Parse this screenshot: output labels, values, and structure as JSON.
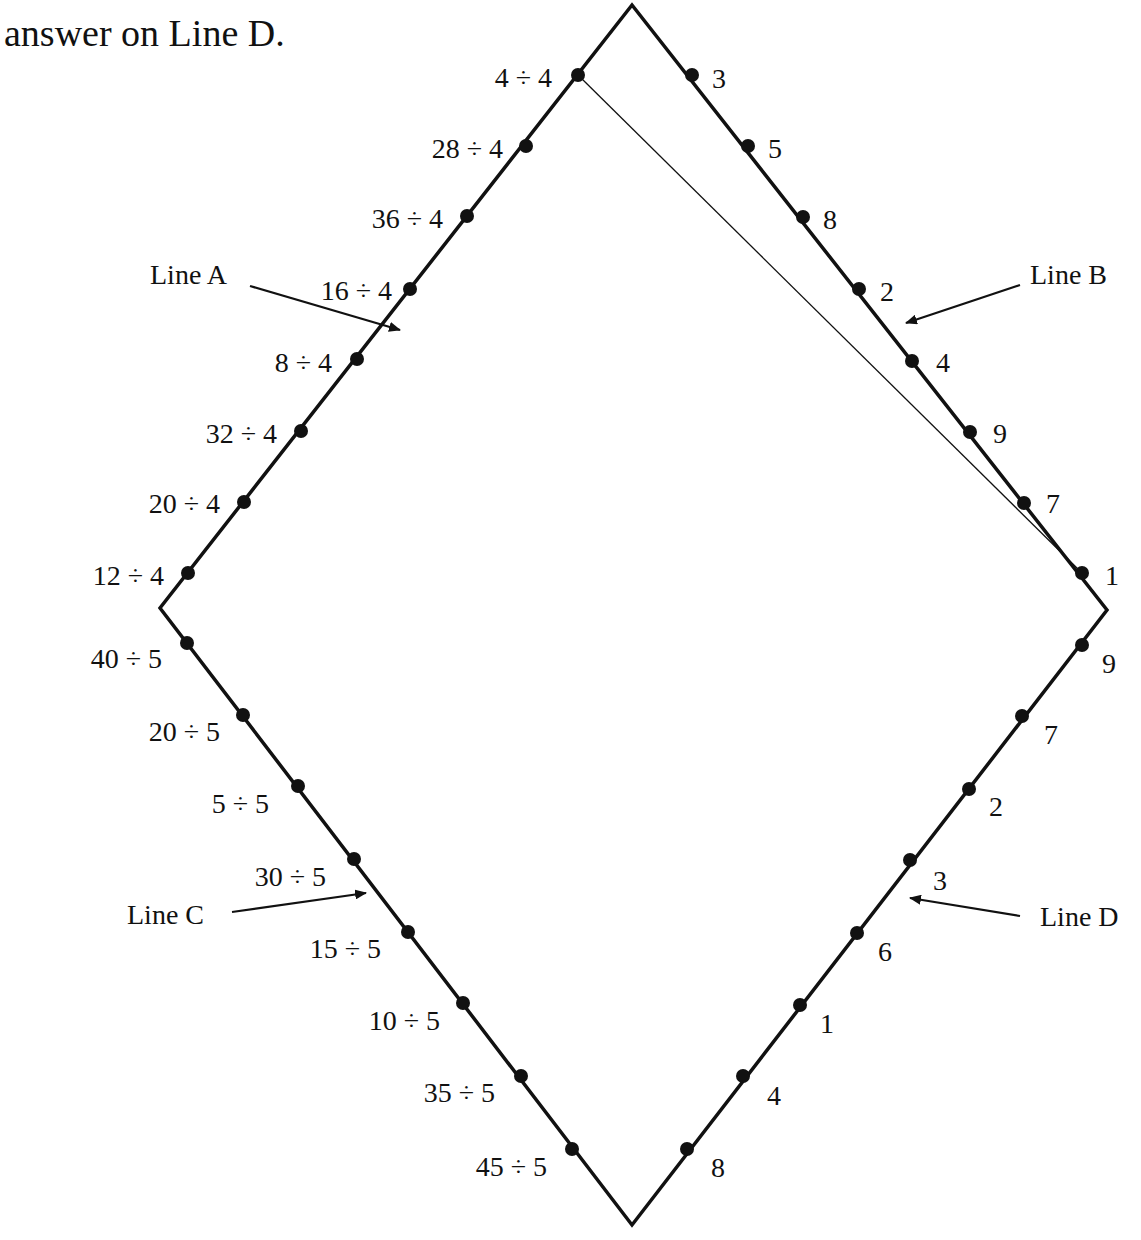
{
  "instruction": "answer on Line D.",
  "colors": {
    "ink": "#111111",
    "background": "#ffffff"
  },
  "diamond": {
    "top": [
      632,
      5
    ],
    "right": [
      1107,
      610
    ],
    "bottom": [
      632,
      1225
    ],
    "left": [
      160,
      608
    ]
  },
  "connector": {
    "from": [
      578,
      75
    ],
    "to": [
      1082,
      573
    ]
  },
  "lines": [
    {
      "name": "Line A",
      "label_pos": [
        150,
        284
      ],
      "arrow": {
        "from": [
          250,
          286
        ],
        "to": [
          400,
          330
        ]
      },
      "points": [
        {
          "text": "4 ÷ 4",
          "dot": [
            578,
            75
          ],
          "label": [
            552,
            77
          ],
          "anchor": "end"
        },
        {
          "text": "28 ÷ 4",
          "dot": [
            526,
            146
          ],
          "label": [
            503,
            148
          ],
          "anchor": "end"
        },
        {
          "text": "36 ÷ 4",
          "dot": [
            467,
            216
          ],
          "label": [
            443,
            218
          ],
          "anchor": "end"
        },
        {
          "text": "16 ÷ 4",
          "dot": [
            410,
            289
          ],
          "label": [
            392,
            290
          ],
          "anchor": "end"
        },
        {
          "text": "8 ÷ 4",
          "dot": [
            357,
            359
          ],
          "label": [
            332,
            362
          ],
          "anchor": "end"
        },
        {
          "text": "32 ÷ 4",
          "dot": [
            301,
            431
          ],
          "label": [
            277,
            433
          ],
          "anchor": "end"
        },
        {
          "text": "20 ÷ 4",
          "dot": [
            244,
            502
          ],
          "label": [
            220,
            503
          ],
          "anchor": "end"
        },
        {
          "text": "12 ÷ 4",
          "dot": [
            188,
            573
          ],
          "label": [
            164,
            575
          ],
          "anchor": "end"
        }
      ]
    },
    {
      "name": "Line B",
      "label_pos": [
        1030,
        284
      ],
      "arrow": {
        "from": [
          1020,
          285
        ],
        "to": [
          906,
          323
        ]
      },
      "points": [
        {
          "text": "3",
          "dot": [
            692,
            75
          ],
          "label": [
            712,
            78
          ],
          "anchor": "start"
        },
        {
          "text": "5",
          "dot": [
            748,
            146
          ],
          "label": [
            768,
            148
          ],
          "anchor": "start"
        },
        {
          "text": "8",
          "dot": [
            803,
            217
          ],
          "label": [
            823,
            219
          ],
          "anchor": "start"
        },
        {
          "text": "2",
          "dot": [
            859,
            289
          ],
          "label": [
            880,
            291
          ],
          "anchor": "start"
        },
        {
          "text": "4",
          "dot": [
            912,
            361
          ],
          "label": [
            936,
            362
          ],
          "anchor": "start"
        },
        {
          "text": "9",
          "dot": [
            970,
            432
          ],
          "label": [
            993,
            433
          ],
          "anchor": "start"
        },
        {
          "text": "7",
          "dot": [
            1024,
            503
          ],
          "label": [
            1046,
            503
          ],
          "anchor": "start"
        },
        {
          "text": "1",
          "dot": [
            1082,
            573
          ],
          "label": [
            1105,
            575
          ],
          "anchor": "start"
        }
      ]
    },
    {
      "name": "Line C",
      "label_pos": [
        127,
        924
      ],
      "arrow": {
        "from": [
          232,
          912
        ],
        "to": [
          366,
          893
        ]
      },
      "points": [
        {
          "text": "40 ÷ 5",
          "dot": [
            187,
            643
          ],
          "label": [
            162,
            658
          ],
          "anchor": "end"
        },
        {
          "text": "20 ÷ 5",
          "dot": [
            243,
            715
          ],
          "label": [
            220,
            731
          ],
          "anchor": "end"
        },
        {
          "text": "5 ÷ 5",
          "dot": [
            298,
            786
          ],
          "label": [
            269,
            803
          ],
          "anchor": "end"
        },
        {
          "text": "30 ÷ 5",
          "dot": [
            354,
            859
          ],
          "label": [
            326,
            876
          ],
          "anchor": "end"
        },
        {
          "text": "15 ÷ 5",
          "dot": [
            408,
            932
          ],
          "label": [
            381,
            948
          ],
          "anchor": "end"
        },
        {
          "text": "10 ÷ 5",
          "dot": [
            463,
            1003
          ],
          "label": [
            440,
            1020
          ],
          "anchor": "end"
        },
        {
          "text": "35 ÷ 5",
          "dot": [
            521,
            1076
          ],
          "label": [
            495,
            1092
          ],
          "anchor": "end"
        },
        {
          "text": "45 ÷ 5",
          "dot": [
            572,
            1149
          ],
          "label": [
            547,
            1166
          ],
          "anchor": "end"
        }
      ]
    },
    {
      "name": "Line D",
      "label_pos": [
        1040,
        926
      ],
      "arrow": {
        "from": [
          1020,
          916
        ],
        "to": [
          910,
          898
        ]
      },
      "points": [
        {
          "text": "9",
          "dot": [
            1082,
            645
          ],
          "label": [
            1102,
            663
          ],
          "anchor": "start"
        },
        {
          "text": "7",
          "dot": [
            1022,
            716
          ],
          "label": [
            1044,
            734
          ],
          "anchor": "start"
        },
        {
          "text": "2",
          "dot": [
            969,
            789
          ],
          "label": [
            989,
            806
          ],
          "anchor": "start"
        },
        {
          "text": "3",
          "dot": [
            910,
            860
          ],
          "label": [
            933,
            880
          ],
          "anchor": "start"
        },
        {
          "text": "6",
          "dot": [
            857,
            933
          ],
          "label": [
            878,
            951
          ],
          "anchor": "start"
        },
        {
          "text": "1",
          "dot": [
            800,
            1005
          ],
          "label": [
            820,
            1023
          ],
          "anchor": "start"
        },
        {
          "text": "4",
          "dot": [
            743,
            1076
          ],
          "label": [
            767,
            1095
          ],
          "anchor": "start"
        },
        {
          "text": "8",
          "dot": [
            687,
            1149
          ],
          "label": [
            711,
            1167
          ],
          "anchor": "start"
        }
      ]
    }
  ]
}
